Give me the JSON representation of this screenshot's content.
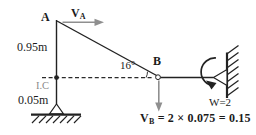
{
  "figure": {
    "background": "#ffffff",
    "colors": {
      "line": "#222222",
      "velocity_arrow": "#8f8f8f",
      "ic_label": "#8a8a8a",
      "text": "#1b1b1b"
    },
    "points": {
      "a": "A",
      "b": "B"
    },
    "labels": {
      "va_symbol": "V",
      "va_subscript": "A",
      "length_upper": "0.95m",
      "instant_center": "I.C",
      "length_lower": "0.05m",
      "angle": "16°",
      "omega": "W=2",
      "vb_symbol": "V",
      "vb_subscript": "B",
      "vb_equation": "= 2 × 0.075 = 0.15"
    }
  }
}
